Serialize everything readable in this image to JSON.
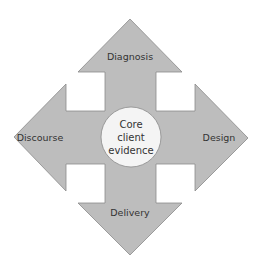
{
  "diagram": {
    "center": {
      "lines": [
        "Core",
        "client",
        "evidence"
      ]
    },
    "arrows": {
      "top": {
        "label": "Diagnosis"
      },
      "left": {
        "label": "Discourse"
      },
      "right": {
        "label": "Design"
      },
      "bottom": {
        "label": "Delivery"
      }
    },
    "colors": {
      "arrow_fill": "#bdbdbd",
      "arrow_stroke": "#8a8a8a",
      "circle_fill": "#f4f4f4",
      "circle_stroke": "#8a8a8a",
      "text": "#333333"
    }
  }
}
